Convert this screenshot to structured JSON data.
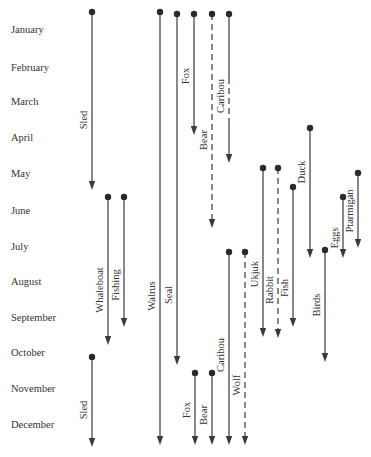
{
  "diagram": {
    "type": "seasonal-activity-calendar",
    "months": [
      {
        "label": "January",
        "y": 30
      },
      {
        "label": "February",
        "y": 68
      },
      {
        "label": "March",
        "y": 102
      },
      {
        "label": "April",
        "y": 138
      },
      {
        "label": "May",
        "y": 174
      },
      {
        "label": "June",
        "y": 211
      },
      {
        "label": "July",
        "y": 247
      },
      {
        "label": "August",
        "y": 282
      },
      {
        "label": "September",
        "y": 318
      },
      {
        "label": "October",
        "y": 353
      },
      {
        "label": "November",
        "y": 389
      },
      {
        "label": "December",
        "y": 425
      }
    ],
    "activities": [
      {
        "label": "Sled",
        "x": 92,
        "y1": 12,
        "y2": 190,
        "style": "solid",
        "label_y": 120,
        "label_side": "left",
        "period": "January–May"
      },
      {
        "label": "Walrus",
        "x": 160,
        "y1": 12,
        "y2": 445,
        "style": "solid",
        "label_y": 296,
        "label_side": "left",
        "period": "January–December"
      },
      {
        "label": "Seal",
        "x": 177,
        "y1": 14,
        "y2": 365,
        "style": "solid",
        "label_y": 295,
        "label_side": "left",
        "period": "January–October"
      },
      {
        "label": "Fox",
        "x": 194,
        "y1": 14,
        "y2": 135,
        "style": "solid",
        "label_y": 76,
        "label_side": "left",
        "period": "January–April"
      },
      {
        "label": "Bear",
        "x": 212,
        "y1": 14,
        "y2": 228,
        "style": "dashed",
        "label_y": 140,
        "label_side": "left",
        "period": "January–June"
      },
      {
        "label": "Caribou",
        "x": 229,
        "y1": 14,
        "y2": 163,
        "style": "mixed",
        "label_y": 96,
        "label_side": "left",
        "period": "January–May"
      },
      {
        "label": "Whaleboat",
        "x": 108,
        "y1": 197,
        "y2": 345,
        "style": "solid",
        "label_y": 290,
        "label_side": "left",
        "period": "June–October"
      },
      {
        "label": "Fishing",
        "x": 124,
        "y1": 197,
        "y2": 327,
        "style": "solid",
        "label_y": 285,
        "label_side": "left",
        "period": "June–September"
      },
      {
        "label": "Sled",
        "x": 92,
        "y1": 357,
        "y2": 447,
        "style": "solid",
        "label_y": 410,
        "label_side": "left",
        "period": "October–December"
      },
      {
        "label": "Duck",
        "x": 310,
        "y1": 128,
        "y2": 258,
        "style": "solid",
        "label_y": 172,
        "label_side": "left",
        "period": "April–July"
      },
      {
        "label": "Ukjuk",
        "x": 263,
        "y1": 168,
        "y2": 337,
        "style": "solid",
        "label_y": 274,
        "label_side": "left",
        "period": "May–September"
      },
      {
        "label": "Rabbit",
        "x": 278,
        "y1": 168,
        "y2": 338,
        "style": "dashed",
        "label_y": 290,
        "label_side": "left",
        "period": "May–September"
      },
      {
        "label": "Fish",
        "x": 293,
        "y1": 187,
        "y2": 327,
        "style": "solid",
        "label_y": 288,
        "label_side": "left",
        "period": "June–September"
      },
      {
        "label": "Eggs",
        "x": 343,
        "y1": 197,
        "y2": 258,
        "style": "solid",
        "label_y": 238,
        "label_side": "left",
        "period": "June–July"
      },
      {
        "label": "Ptarmigan",
        "x": 358,
        "y1": 173,
        "y2": 248,
        "style": "solid",
        "label_y": 211,
        "label_side": "left",
        "period": "May–July"
      },
      {
        "label": "Birds",
        "x": 325,
        "y1": 250,
        "y2": 362,
        "style": "solid",
        "label_y": 305,
        "label_side": "left",
        "period": "July–October"
      },
      {
        "label": "Caribou",
        "x": 229,
        "y1": 252,
        "y2": 445,
        "style": "solid",
        "label_y": 355,
        "label_side": "left",
        "period": "July–December"
      },
      {
        "label": "Wolf",
        "x": 245,
        "y1": 252,
        "y2": 445,
        "style": "dashed",
        "label_y": 385,
        "label_side": "left",
        "period": "July–December"
      },
      {
        "label": "Fox",
        "x": 195,
        "y1": 373,
        "y2": 445,
        "style": "solid",
        "label_y": 410,
        "label_side": "left",
        "period": "November–December"
      },
      {
        "label": "Bear",
        "x": 212,
        "y1": 373,
        "y2": 445,
        "style": "solid",
        "label_y": 415,
        "label_side": "left",
        "period": "November–December"
      }
    ]
  }
}
